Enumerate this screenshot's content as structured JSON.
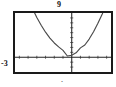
{
  "figure": {
    "kind": "graphing-calculator-window",
    "frame_color": "#1a1a1a",
    "background": "#ffffff"
  },
  "labels": {
    "y_max": "9",
    "y_min": "-3",
    "x_tick_mark": "·"
  },
  "chart_data": {
    "type": "line",
    "title": "",
    "subtitle": "",
    "xlabel": "",
    "ylabel": "",
    "grid": false,
    "legend": null,
    "legend_position": "none",
    "curve_color": "#4a4a4a",
    "axis_color": "#222222",
    "xlim": [
      -6.5,
      4.5
    ],
    "ylim": [
      -3,
      9
    ],
    "x_axis_at_y": 0,
    "y_axis_at_x": 0,
    "x_tick_spacing": 1,
    "y_tick_spacing": 1,
    "annotations": [
      {
        "text": "9",
        "position": "above-top-frame-at-y-axis"
      },
      {
        "text": "-3",
        "position": "left-of-frame-at-x-axis"
      }
    ],
    "series": [
      {
        "name": "parabola",
        "equation": "y = 0.55*(x + 0.55)^2 + 0.25",
        "x": [
          -6.5,
          -6.0,
          -5.5,
          -5.0,
          -4.5,
          -4.0,
          -3.5,
          -3.0,
          -2.5,
          -2.0,
          -1.5,
          -1.0,
          -0.5,
          0.0,
          0.5,
          1.0,
          1.5,
          2.0,
          2.5,
          3.0,
          3.5,
          4.0,
          4.5
        ],
        "values": [
          19.1,
          16.5,
          14.1,
          11.9,
          9.9,
          8.1,
          6.5,
          5.1,
          3.9,
          2.9,
          2.1,
          1.4,
          0.25,
          0.42,
          0.9,
          1.9,
          2.5,
          3.7,
          5.2,
          6.9,
          8.8,
          11.0,
          13.3
        ]
      }
    ]
  }
}
